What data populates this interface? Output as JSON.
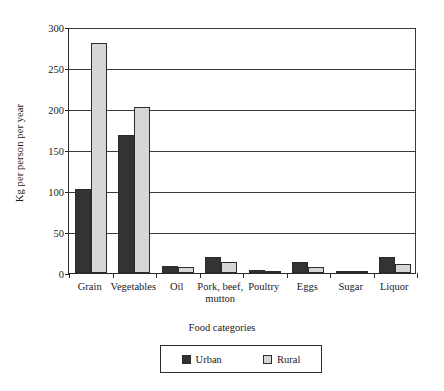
{
  "chart_data": {
    "type": "bar",
    "title": "",
    "xlabel": "Food categories",
    "ylabel": "Kg per person per year",
    "categories": [
      "Grain",
      "Vegetables",
      "Oil",
      "Pork, beef,\nmutton",
      "Poultry",
      "Eggs",
      "Sugar",
      "Liquor"
    ],
    "series": [
      {
        "name": "Urban",
        "color": "#333333",
        "values": [
          103,
          168,
          8,
          19,
          4,
          14,
          2,
          19
        ]
      },
      {
        "name": "Rural",
        "color": "#d6d6d6",
        "values": [
          280,
          202,
          7,
          13,
          3,
          7,
          2,
          11
        ]
      }
    ],
    "ylim": [
      0,
      300
    ],
    "yticks": [
      0,
      50,
      100,
      150,
      200,
      250,
      300
    ],
    "ytick_labels": [
      "0",
      "50",
      "100",
      "150",
      "200",
      "250",
      "300"
    ],
    "grid": true,
    "legend_position": "bottom-center"
  },
  "legend": {
    "entries": [
      {
        "label": "Urban",
        "color": "#333333"
      },
      {
        "label": "Rural",
        "color": "#d6d6d6"
      }
    ]
  }
}
